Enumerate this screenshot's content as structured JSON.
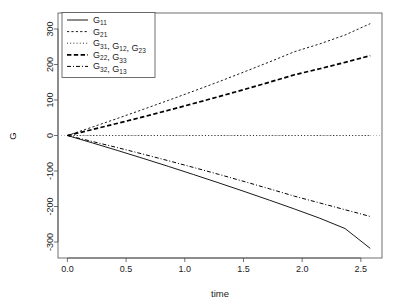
{
  "chart_data": {
    "type": "line",
    "title": "",
    "xlabel": "time",
    "ylabel": "G",
    "xlim": [
      -0.08,
      2.68
    ],
    "ylim": [
      -345,
      345
    ],
    "xticks": [
      "0.0",
      "0.5",
      "1.0",
      "1.5",
      "2.0",
      "2.5"
    ],
    "xtick_values": [
      0.0,
      0.5,
      1.0,
      1.5,
      2.0,
      2.5
    ],
    "yticks": [
      "300",
      "200",
      "100",
      "0",
      "-100",
      "-200",
      "-300"
    ],
    "ytick_values": [
      300,
      200,
      100,
      0,
      -100,
      -200,
      -300
    ],
    "grid": false,
    "legend_position": "top-left",
    "x": [
      0.0,
      0.215,
      0.43,
      0.645,
      0.86,
      1.075,
      1.29,
      1.505,
      1.72,
      1.935,
      2.15,
      2.365,
      2.58
    ],
    "series": [
      {
        "name": "G11",
        "label": "G",
        "sub": "11",
        "linestyle": "solid",
        "linewidth": 0.9,
        "color": "#000000",
        "values": [
          0,
          -21,
          -42.5,
          -64.5,
          -87,
          -110,
          -133.5,
          -157.5,
          -182,
          -207,
          -233,
          -262,
          -318
        ]
      },
      {
        "name": "G21",
        "label": "G",
        "sub": "21",
        "linestyle": "dotted-fine",
        "linewidth": 0.9,
        "color": "#000000",
        "values": [
          0,
          24,
          48.5,
          73.5,
          99,
          125,
          151.5,
          179,
          207,
          236,
          258,
          283,
          315
        ]
      },
      {
        "name": "G31, G12, G23",
        "label": "G",
        "sub": "31",
        "label2": "G",
        "sub2": "12",
        "label3": "G",
        "sub3": "23",
        "linestyle": "dotted",
        "linewidth": 0.8,
        "color": "#000000",
        "values": [
          0,
          0,
          0,
          0,
          0,
          0,
          0,
          0,
          0,
          0,
          0,
          0,
          0
        ]
      },
      {
        "name": "G22, G33",
        "label": "G",
        "sub": "22",
        "label2": "G",
        "sub2": "33",
        "linestyle": "dashed-bold",
        "linewidth": 1.7,
        "color": "#000000",
        "values": [
          0,
          17,
          34.5,
          52.5,
          71,
          90,
          109.5,
          129.5,
          150,
          171,
          188,
          206,
          225
        ]
      },
      {
        "name": "G32, G13",
        "label": "G",
        "sub": "32",
        "label2": "G",
        "sub2": "13",
        "linestyle": "dashdot",
        "linewidth": 1.0,
        "color": "#000000",
        "values": [
          0,
          -17,
          -34.5,
          -52.5,
          -71,
          -90,
          -109.5,
          -129.5,
          -150,
          -171,
          -190,
          -209,
          -228
        ]
      }
    ],
    "zero_reference_line": {
      "value": 0,
      "style": "dotted",
      "color": "#999999"
    }
  },
  "legend": {
    "entries": [
      {
        "label": "G",
        "sub": "11",
        "extra": ""
      },
      {
        "label": "G",
        "sub": "21",
        "extra": ""
      },
      {
        "label": "G",
        "sub": "31",
        "extra": ", G12, G23"
      },
      {
        "label": "G",
        "sub": "22",
        "extra": ", G33"
      },
      {
        "label": "G",
        "sub": "32",
        "extra": ", G13"
      }
    ],
    "items": [
      {
        "text": "G11"
      },
      {
        "text": "G21"
      },
      {
        "text": "G31, G12, G23"
      },
      {
        "text": "G22, G33"
      },
      {
        "text": "G32, G13"
      }
    ]
  },
  "axes": {
    "x_title": "time",
    "y_title": "G"
  }
}
